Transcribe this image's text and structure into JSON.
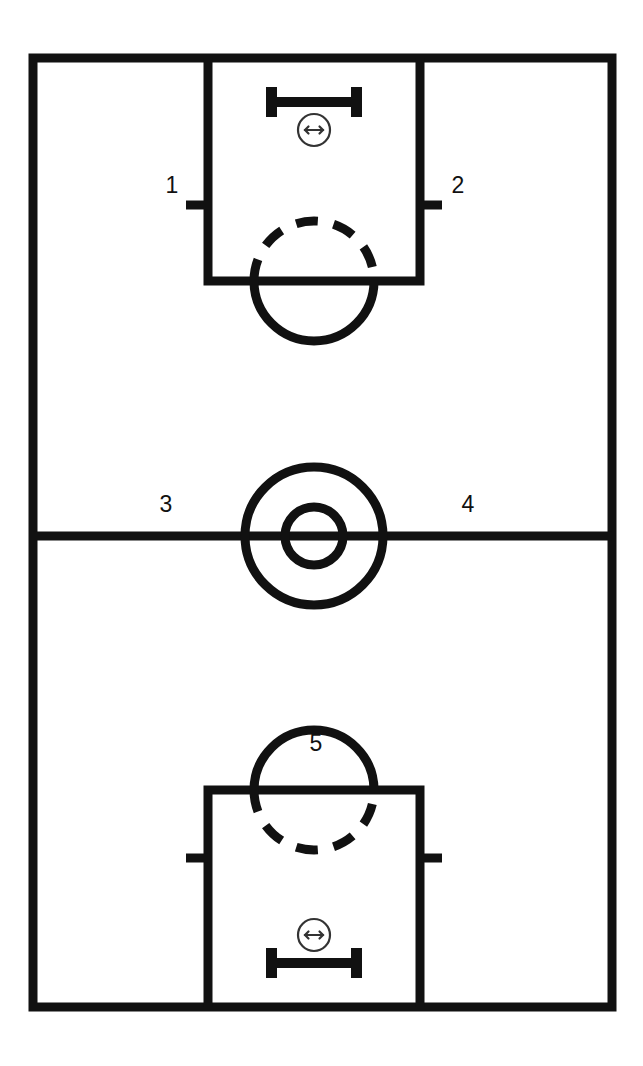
{
  "figure": {
    "type": "court-diagram",
    "background_color": "#ffffff",
    "line_color": "#111111",
    "accent_color": "#333333"
  },
  "court": {
    "orientation": "vertical",
    "outline": {
      "x": 33,
      "y": 58,
      "width": 579,
      "height": 949
    },
    "line_width": 9,
    "halfcourt_line": {
      "y": 536,
      "x1": 33,
      "x2": 612
    }
  },
  "center_circle": {
    "center_x": 314,
    "center_y": 536,
    "outer_radius": 69,
    "inner_radius": 29,
    "stroke_width": 9
  },
  "keys": [
    {
      "id": "top-key",
      "name": "top-free-throw-lane",
      "lane": {
        "x": 208,
        "y_top": 58,
        "x2": 420,
        "y_bottom": 281
      },
      "free_throw_line_y": 281,
      "circle": {
        "center_x": 314,
        "center_y": 281,
        "radius": 60
      },
      "dashed_half": "top",
      "solid_half": "bottom",
      "hash_mark_y": 205,
      "hash_mark_length": 22,
      "backboard": {
        "center_x": 314,
        "y": 97,
        "width": 96,
        "post_height": 30,
        "bar_thickness": 10
      },
      "hoop_marker": {
        "center_x": 314,
        "center_y": 130,
        "radius": 16,
        "arrow_half_width": 9
      }
    },
    {
      "id": "bottom-key",
      "name": "bottom-free-throw-lane",
      "lane": {
        "x": 208,
        "y_top": 790,
        "x2": 420,
        "y_bottom": 1007
      },
      "free_throw_line_y": 790,
      "circle": {
        "center_x": 314,
        "center_y": 790,
        "radius": 60
      },
      "dashed_half": "bottom",
      "solid_half": "top",
      "hash_mark_y": 858,
      "hash_mark_length": 22,
      "backboard": {
        "center_x": 314,
        "y": 968,
        "width": 96,
        "post_height": 30,
        "bar_thickness": 10
      },
      "hoop_marker": {
        "center_x": 314,
        "center_y": 935,
        "radius": 16,
        "arrow_half_width": 9
      }
    }
  ],
  "labels": [
    {
      "id": "zone-1",
      "text": "1",
      "x": 172,
      "y": 187
    },
    {
      "id": "zone-2",
      "text": "2",
      "x": 458,
      "y": 187
    },
    {
      "id": "zone-3",
      "text": "3",
      "x": 166,
      "y": 506
    },
    {
      "id": "zone-4",
      "text": "4",
      "x": 468,
      "y": 506
    },
    {
      "id": "zone-5",
      "text": "5",
      "x": 316,
      "y": 745
    }
  ]
}
